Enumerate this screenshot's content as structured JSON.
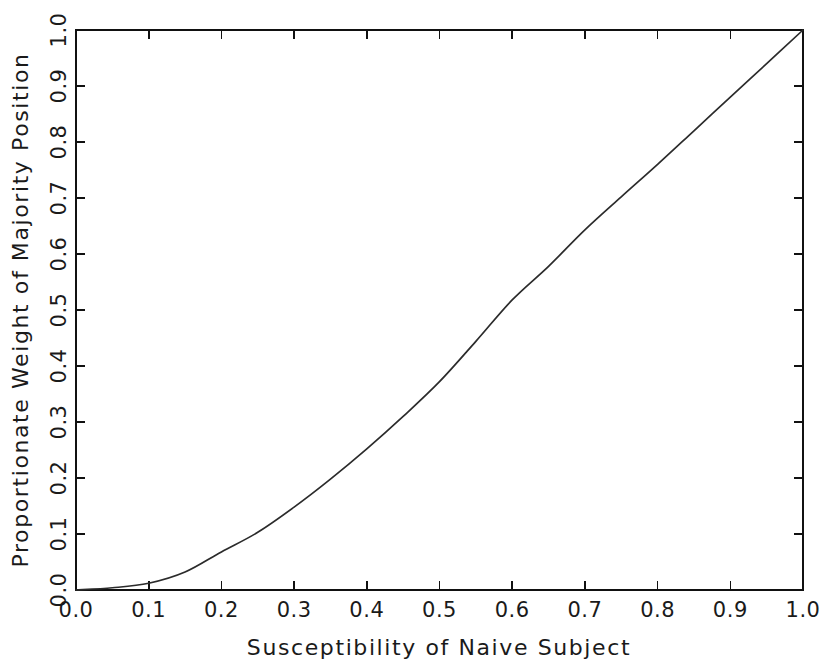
{
  "chart_data": {
    "type": "line",
    "title": "",
    "xlabel": "Susceptibility of Naive Subject",
    "ylabel": "Proportionate Weight of Majority Position",
    "xlim": [
      0.0,
      1.0
    ],
    "ylim": [
      0.0,
      1.0
    ],
    "grid": false,
    "legend": null,
    "xticks": [
      "0.0",
      "0.1",
      "0.2",
      "0.3",
      "0.4",
      "0.5",
      "0.6",
      "0.7",
      "0.8",
      "0.9",
      "1.0"
    ],
    "yticks": [
      "0.0",
      "0.1",
      "0.2",
      "0.3",
      "0.4",
      "0.5",
      "0.6",
      "0.7",
      "0.8",
      "0.9",
      "1.0"
    ],
    "xtick_values": [
      0.0,
      0.1,
      0.2,
      0.3,
      0.4,
      0.5,
      0.6,
      0.7,
      0.8,
      0.9,
      1.0
    ],
    "ytick_values": [
      0.0,
      0.1,
      0.2,
      0.3,
      0.4,
      0.5,
      0.6,
      0.7,
      0.8,
      0.9,
      1.0
    ],
    "series": [
      {
        "name": "Proportionate weight curve",
        "color": "#2b2b2b",
        "x": [
          0.0,
          0.05,
          0.1,
          0.15,
          0.2,
          0.25,
          0.3,
          0.35,
          0.4,
          0.45,
          0.5,
          0.55,
          0.6,
          0.65,
          0.7,
          0.75,
          0.8,
          0.85,
          0.9,
          0.95,
          1.0
        ],
        "y": [
          0.0,
          0.004,
          0.012,
          0.032,
          0.068,
          0.103,
          0.148,
          0.198,
          0.252,
          0.31,
          0.372,
          0.444,
          0.518,
          0.578,
          0.643,
          0.702,
          0.76,
          0.82,
          0.88,
          0.94,
          1.0
        ]
      }
    ]
  },
  "axes": {
    "x_title": "Susceptibility of Naive Subject",
    "y_title": "Proportionate Weight of Majority Position"
  }
}
